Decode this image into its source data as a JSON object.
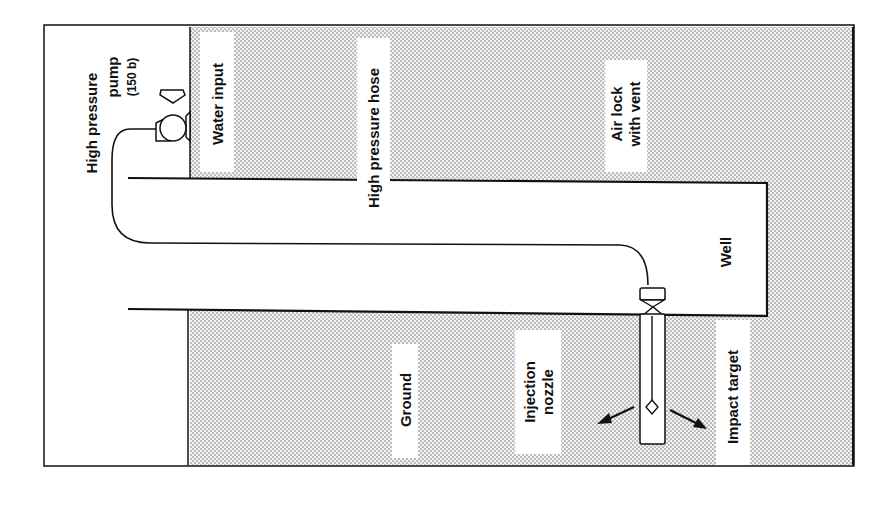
{
  "diagram": {
    "title": "",
    "colors": {
      "line": "#111111",
      "stipple_dot": "#8a8a8a",
      "stipple_bg": "#f2f2f2",
      "background": "#ffffff"
    },
    "labels": {
      "pump_line1": "High pressure",
      "pump_line2": "pump",
      "pump_line3": "(150 b)",
      "water_input": "Water input",
      "hose": "High pressure hose",
      "air_lock_line1": "Air lock",
      "air_lock_line2": "with vent",
      "well": "Well",
      "ground": "Ground",
      "nozzle_line1": "Injection",
      "nozzle_line2": "nozzle",
      "impact_target": "Impact target"
    },
    "components": [
      {
        "id": "high-pressure-pump",
        "label": "High pressure pump (150 b)"
      },
      {
        "id": "water-input",
        "label": "Water input"
      },
      {
        "id": "high-pressure-hose",
        "label": "High pressure hose"
      },
      {
        "id": "air-lock",
        "label": "Air lock with vent"
      },
      {
        "id": "well",
        "label": "Well"
      },
      {
        "id": "ground",
        "label": "Ground"
      },
      {
        "id": "injection-nozzle",
        "label": "Injection nozzle"
      },
      {
        "id": "impact-target",
        "label": "Impact target"
      }
    ],
    "orientation": "rotated 90° counter-clockwise (labels read bottom-to-top)"
  }
}
